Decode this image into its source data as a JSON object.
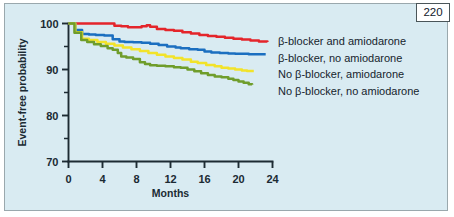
{
  "page": {
    "number": "220"
  },
  "chart_data": {
    "type": "line",
    "title": "",
    "xlabel": "Months",
    "ylabel": "Event-free probability",
    "xlim": [
      0,
      24
    ],
    "ylim": [
      70,
      100
    ],
    "grid": false,
    "legend_position": "right",
    "x_ticks": [
      "0",
      "4",
      "8",
      "12",
      "16",
      "20",
      "24"
    ],
    "x_tick_values": [
      0,
      4,
      8,
      12,
      16,
      20,
      24
    ],
    "y_ticks": [
      "70",
      "80",
      "90",
      "100"
    ],
    "y_tick_values": [
      70,
      80,
      90,
      100
    ],
    "y_minor_tick_values": [
      75,
      85,
      95
    ],
    "series": [
      {
        "name": "β-blocker and amiodarone",
        "color": "#e4252b",
        "x": [
          0,
          1,
          2,
          3,
          4,
          5,
          5.4,
          6.2,
          7,
          8,
          8.6,
          9.2,
          9.6,
          10.4,
          11.4,
          12.4,
          13.4,
          14.4,
          15.4,
          16.4,
          17.4,
          18.4,
          19.4,
          20.4,
          21.4,
          22.4,
          23.4
        ],
        "y": [
          100,
          100,
          100,
          100,
          100,
          100,
          99.5,
          99.4,
          99.2,
          99.2,
          99.4,
          99.6,
          99.3,
          98.8,
          98.6,
          98.4,
          98.1,
          97.8,
          97.5,
          97.3,
          97.1,
          96.9,
          96.7,
          96.5,
          96.3,
          96.1,
          96.0
        ]
      },
      {
        "name": "β-blocker, no amiodarone",
        "color": "#1b6fc0",
        "x": [
          0,
          0.8,
          1.6,
          2.4,
          3.2,
          4.2,
          5.2,
          6.0,
          6.6,
          7.6,
          8.6,
          9.6,
          10.6,
          11.6,
          12.6,
          13.2,
          14.2,
          15.2,
          16.0,
          16.8,
          17.8,
          18.8,
          19.6,
          20.2,
          21.2,
          22.2,
          23.2
        ],
        "y": [
          100,
          98.6,
          97.7,
          97.6,
          97.5,
          97.4,
          96.6,
          96.1,
          96.0,
          95.9,
          95.8,
          95.6,
          95.3,
          95.0,
          94.8,
          94.6,
          94.4,
          94.3,
          93.9,
          93.7,
          93.6,
          93.5,
          93.4,
          93.4,
          93.3,
          93.3,
          93.3
        ]
      },
      {
        "name": "No β-blocker, amiodarone",
        "color": "#f2e32a",
        "x": [
          0,
          0.8,
          1.6,
          2.4,
          3.4,
          4.4,
          5.4,
          6.4,
          7.4,
          8.4,
          9.4,
          10.4,
          11.4,
          12.4,
          13.4,
          14.4,
          15.2,
          16.2,
          17.2,
          18.0,
          18.8,
          19.6,
          20.4,
          21.0,
          21.8
        ],
        "y": [
          100,
          98.1,
          96.7,
          96.4,
          96.0,
          95.6,
          95.2,
          94.8,
          94.4,
          94.0,
          93.6,
          93.2,
          92.8,
          92.5,
          92.2,
          91.7,
          91.4,
          91.0,
          90.7,
          90.4,
          90.2,
          90.0,
          89.8,
          89.7,
          89.7
        ]
      },
      {
        "name": "No β-blocker, no amiodarone",
        "color": "#6f9d2b",
        "x": [
          0,
          0.7,
          1.5,
          2.2,
          3.0,
          3.8,
          4.6,
          5.2,
          5.8,
          6.2,
          6.8,
          7.6,
          8.4,
          9.0,
          9.6,
          10.4,
          11.4,
          12.4,
          13.2,
          14.0,
          14.8,
          15.6,
          16.4,
          17.2,
          18.0,
          18.8,
          19.4,
          20.0,
          20.6,
          21.2,
          21.6
        ],
        "y": [
          100,
          98.0,
          96.4,
          96.0,
          95.5,
          95.1,
          94.6,
          94.3,
          93.6,
          92.8,
          92.6,
          92.3,
          91.6,
          91.2,
          90.9,
          90.8,
          90.7,
          90.5,
          90.4,
          90.0,
          89.6,
          89.2,
          88.8,
          88.5,
          88.3,
          88.0,
          87.7,
          87.4,
          87.1,
          86.8,
          86.7
        ]
      }
    ]
  },
  "legend": {
    "items": [
      {
        "label": "β-blocker and amiodarone"
      },
      {
        "label": "β-blocker, no amiodarone"
      },
      {
        "label": "No β-blocker, amiodarone"
      },
      {
        "label": "No β-blocker, no amiodarone"
      }
    ]
  }
}
